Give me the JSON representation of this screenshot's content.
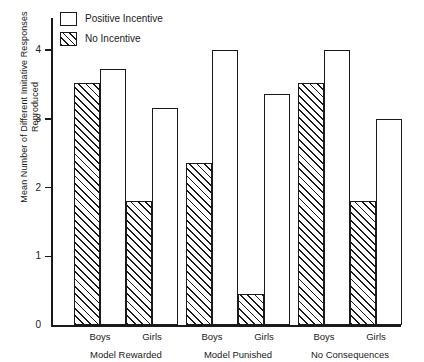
{
  "chart_data": {
    "type": "bar",
    "title": "",
    "xlabel": "",
    "ylabel": "Mean Number of Different Imitative Responses Reproduced",
    "ylim": [
      0,
      4.35
    ],
    "yticks": [
      0,
      1,
      2,
      3,
      4
    ],
    "ytick_labels": [
      "0",
      "1",
      "2",
      "3",
      "4"
    ],
    "grid": false,
    "legend_position": "top-left",
    "categories": [
      "Boys",
      "Girls",
      "Boys",
      "Girls",
      "Boys",
      "Girls"
    ],
    "groups": [
      {
        "label": "Model Rewarded",
        "subgroups": [
          {
            "label": "Boys",
            "no_incentive": 3.52,
            "positive_incentive": 3.72
          },
          {
            "label": "Girls",
            "no_incentive": 1.8,
            "positive_incentive": 3.15
          }
        ]
      },
      {
        "label": "Model Punished",
        "subgroups": [
          {
            "label": "Boys",
            "no_incentive": 2.36,
            "positive_incentive": 4.0
          },
          {
            "label": "Girls",
            "no_incentive": 0.45,
            "positive_incentive": 3.36
          }
        ]
      },
      {
        "label": "No Consequences",
        "subgroups": [
          {
            "label": "Boys",
            "no_incentive": 3.52,
            "positive_incentive": 4.0
          },
          {
            "label": "Girls",
            "no_incentive": 1.8,
            "positive_incentive": 3.0
          }
        ]
      }
    ],
    "series": [
      {
        "name": "No Incentive",
        "pattern": "hatched",
        "values": [
          3.52,
          1.8,
          2.36,
          0.45,
          3.52,
          1.8
        ]
      },
      {
        "name": "Positive Incentive",
        "pattern": "open",
        "values": [
          3.72,
          3.15,
          4.0,
          3.36,
          4.0,
          3.0
        ]
      }
    ]
  },
  "legend": {
    "items": [
      {
        "label": "Positive Incentive",
        "pattern": "open"
      },
      {
        "label": "No Incentive",
        "pattern": "hatched"
      }
    ]
  },
  "axis": {
    "y_title": "Mean Number of Different Imitative Responses Reproduced",
    "y_tick_labels": [
      "4",
      "3",
      "2",
      "1",
      "0"
    ]
  },
  "colors": {
    "ink": "#1a1a1a",
    "background": "#ffffff"
  }
}
